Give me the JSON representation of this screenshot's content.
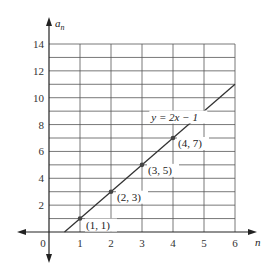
{
  "chart_data": {
    "type": "line",
    "title": "",
    "xlabel": "n",
    "ylabel": "a",
    "ylabel_subscript": "n",
    "xlim": [
      0,
      6
    ],
    "ylim": [
      0,
      14
    ],
    "grid": true,
    "grid_x_step": 1,
    "grid_y_step": 1,
    "x_ticks": [
      0,
      1,
      2,
      3,
      4,
      5,
      6
    ],
    "x_tick_labels": [
      "0",
      "1",
      "2",
      "3",
      "4",
      "5",
      "6"
    ],
    "y_ticks": [
      2,
      4,
      6,
      8,
      10,
      12,
      14
    ],
    "y_tick_labels": [
      "2",
      "4",
      "6",
      "8",
      "10",
      "12",
      "14"
    ],
    "series": [
      {
        "name": "y = 2x − 1",
        "equation": "y = 2x − 1",
        "slope": 2,
        "intercept": -1,
        "x_range": [
          0.5,
          6
        ],
        "color": "#333333"
      }
    ],
    "points": [
      {
        "x": 1,
        "y": 1,
        "label": "(1, 1)"
      },
      {
        "x": 2,
        "y": 3,
        "label": "(2, 3)"
      },
      {
        "x": 3,
        "y": 5,
        "label": "(3, 5)"
      },
      {
        "x": 4,
        "y": 7,
        "label": "(4, 7)"
      }
    ],
    "annotations": [
      {
        "text": "y = 2x − 1",
        "x": 3.3,
        "y": 8.3
      }
    ]
  }
}
